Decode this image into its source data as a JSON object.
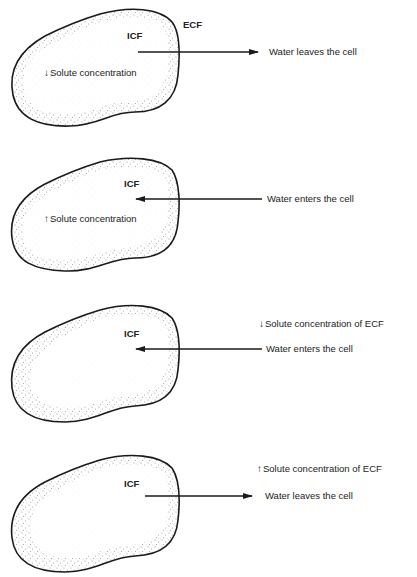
{
  "panels": [
    {
      "id": "panel-1",
      "icf_label": "ICF",
      "ecf_label": "ECF",
      "inner_arrow": "↓",
      "inner_text": "Solute concentration",
      "flow_text": "Water leaves the cell",
      "flow_direction": "out"
    },
    {
      "id": "panel-2",
      "icf_label": "ICF",
      "inner_arrow": "↑",
      "inner_text": "Solute concentration",
      "flow_text": "Water enters the cell",
      "flow_direction": "in"
    },
    {
      "id": "panel-3",
      "icf_label": "ICF",
      "outer_arrow": "↓",
      "outer_text": "Solute concentration of ECF",
      "flow_text": "Water enters the cell",
      "flow_direction": "in"
    },
    {
      "id": "panel-4",
      "icf_label": "ICF",
      "outer_arrow": "↑",
      "outer_text": "Solute concentration of ECF",
      "flow_text": "Water leaves the cell",
      "flow_direction": "out"
    }
  ],
  "colors": {
    "ink": "#1a1a1a",
    "background": "#ffffff"
  }
}
